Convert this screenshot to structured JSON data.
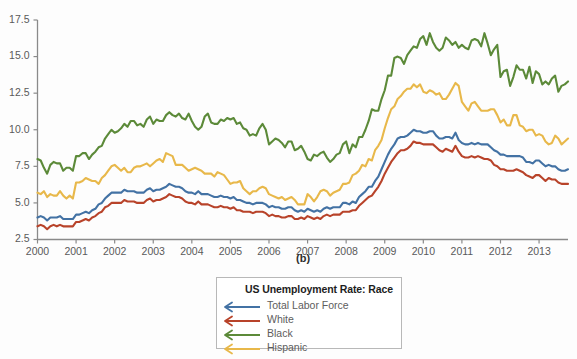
{
  "panel_letter": "(b)",
  "legend": {
    "title": "US Unemployment Rate: Race",
    "items": [
      {
        "label": "Total Labor Force",
        "color": "#4372a4",
        "icon": "left-arrow-icon"
      },
      {
        "label": "White",
        "color": "#b8432a",
        "icon": "left-arrow-icon"
      },
      {
        "label": "Black",
        "color": "#5c8a39",
        "icon": "left-arrow-icon"
      },
      {
        "label": "Hispanic",
        "color": "#e8b84a",
        "icon": "left-arrow-icon"
      }
    ]
  },
  "chart_data": {
    "type": "line",
    "title": "US Unemployment Rate: Race",
    "xlabel": "",
    "ylabel": "",
    "xlim": [
      2000,
      2013.75
    ],
    "ylim": [
      2.5,
      17.5
    ],
    "yticks": [
      "2.5",
      "5.0",
      "7.5",
      "10.0",
      "12.5",
      "15.0",
      "17.5"
    ],
    "ytick_values": [
      2.5,
      5.0,
      7.5,
      10.0,
      12.5,
      15.0,
      17.5
    ],
    "xticks": [
      "2000",
      "2001",
      "2002",
      "2003",
      "2004",
      "2005",
      "2006",
      "2007",
      "2008",
      "2009",
      "2010",
      "2011",
      "2012",
      "2013"
    ],
    "xtick_values": [
      2000,
      2001,
      2002,
      2003,
      2004,
      2005,
      2006,
      2007,
      2008,
      2009,
      2010,
      2011,
      2012,
      2013
    ],
    "grid": false,
    "legend_position": "bottom-center",
    "x_step_years": 0.08333333,
    "series": [
      {
        "name": "Total Labor Force",
        "color": "#4372a4",
        "values": [
          4.0,
          4.1,
          4.0,
          3.8,
          4.0,
          4.0,
          4.0,
          4.1,
          3.9,
          3.9,
          3.9,
          3.9,
          4.2,
          4.2,
          4.3,
          4.4,
          4.3,
          4.5,
          4.6,
          4.9,
          5.0,
          5.3,
          5.5,
          5.7,
          5.7,
          5.7,
          5.7,
          5.9,
          5.8,
          5.8,
          5.8,
          5.7,
          5.7,
          5.7,
          5.9,
          6.0,
          5.8,
          5.9,
          5.9,
          6.0,
          6.1,
          6.3,
          6.2,
          6.1,
          6.1,
          6.0,
          5.8,
          5.7,
          5.7,
          5.6,
          5.8,
          5.6,
          5.6,
          5.6,
          5.5,
          5.4,
          5.4,
          5.5,
          5.4,
          5.4,
          5.3,
          5.4,
          5.2,
          5.2,
          5.1,
          5.0,
          5.0,
          4.9,
          5.0,
          5.0,
          5.0,
          4.9,
          4.7,
          4.8,
          4.7,
          4.7,
          4.6,
          4.6,
          4.7,
          4.7,
          4.5,
          4.4,
          4.5,
          4.4,
          4.6,
          4.5,
          4.4,
          4.5,
          4.4,
          4.6,
          4.7,
          4.6,
          4.7,
          4.7,
          4.7,
          5.0,
          5.0,
          4.9,
          5.1,
          5.0,
          5.4,
          5.6,
          5.8,
          6.1,
          6.1,
          6.5,
          6.8,
          7.3,
          7.8,
          8.3,
          8.7,
          9.0,
          9.4,
          9.5,
          9.5,
          9.6,
          9.8,
          10.0,
          9.9,
          9.9,
          9.8,
          9.8,
          9.9,
          9.9,
          9.6,
          9.4,
          9.4,
          9.5,
          9.5,
          9.4,
          9.8,
          9.3,
          9.1,
          9.0,
          9.0,
          9.1,
          9.0,
          9.1,
          9.0,
          9.0,
          9.0,
          8.8,
          8.6,
          8.5,
          8.3,
          8.3,
          8.2,
          8.2,
          8.2,
          8.2,
          8.2,
          8.1,
          7.8,
          7.8,
          7.7,
          7.9,
          7.9,
          7.7,
          7.5,
          7.6,
          7.5,
          7.5,
          7.3,
          7.2,
          7.2,
          7.3
        ]
      },
      {
        "name": "White",
        "color": "#b8432a",
        "values": [
          3.4,
          3.5,
          3.4,
          3.2,
          3.4,
          3.5,
          3.4,
          3.5,
          3.4,
          3.4,
          3.4,
          3.4,
          3.7,
          3.7,
          3.8,
          3.9,
          3.8,
          4.0,
          4.1,
          4.3,
          4.4,
          4.7,
          4.8,
          5.0,
          5.0,
          5.0,
          5.0,
          5.2,
          5.1,
          5.1,
          5.1,
          5.0,
          5.0,
          5.0,
          5.2,
          5.3,
          5.1,
          5.2,
          5.2,
          5.3,
          5.4,
          5.6,
          5.5,
          5.4,
          5.4,
          5.3,
          5.1,
          5.0,
          5.0,
          4.9,
          5.1,
          4.9,
          4.9,
          4.9,
          4.8,
          4.7,
          4.7,
          4.8,
          4.7,
          4.7,
          4.6,
          4.7,
          4.5,
          4.5,
          4.4,
          4.4,
          4.4,
          4.3,
          4.4,
          4.4,
          4.4,
          4.3,
          4.1,
          4.2,
          4.1,
          4.1,
          4.0,
          4.0,
          4.1,
          4.1,
          3.9,
          3.9,
          4.0,
          3.9,
          4.1,
          4.0,
          3.9,
          4.0,
          3.9,
          4.1,
          4.2,
          4.1,
          4.2,
          4.2,
          4.2,
          4.4,
          4.4,
          4.4,
          4.5,
          4.5,
          4.8,
          5.0,
          5.2,
          5.4,
          5.5,
          5.8,
          6.1,
          6.5,
          7.0,
          7.4,
          7.8,
          8.1,
          8.4,
          8.6,
          8.6,
          8.7,
          8.9,
          9.2,
          9.1,
          9.1,
          9.0,
          9.0,
          9.0,
          9.0,
          8.8,
          8.6,
          8.5,
          8.7,
          8.6,
          8.5,
          8.9,
          8.5,
          8.2,
          8.1,
          8.1,
          8.2,
          8.1,
          8.2,
          8.1,
          8.0,
          8.0,
          7.9,
          7.6,
          7.5,
          7.3,
          7.3,
          7.2,
          7.2,
          7.2,
          7.3,
          7.2,
          7.1,
          6.9,
          6.8,
          6.7,
          6.9,
          6.9,
          6.7,
          6.5,
          6.7,
          6.6,
          6.6,
          6.4,
          6.3,
          6.3,
          6.3
        ]
      },
      {
        "name": "Black",
        "color": "#5c8a39",
        "values": [
          8.0,
          7.9,
          7.4,
          7.0,
          7.6,
          7.8,
          7.7,
          7.7,
          7.2,
          7.4,
          7.4,
          7.2,
          8.2,
          8.2,
          8.4,
          8.4,
          8.0,
          8.3,
          8.5,
          8.8,
          8.9,
          9.4,
          9.7,
          10.0,
          9.8,
          9.9,
          10.1,
          10.4,
          10.2,
          10.6,
          10.6,
          10.3,
          10.4,
          10.2,
          10.7,
          10.9,
          10.4,
          10.7,
          10.6,
          10.6,
          11.0,
          11.2,
          11.0,
          10.9,
          11.1,
          10.8,
          10.7,
          11.1,
          10.6,
          10.2,
          10.0,
          10.2,
          10.9,
          11.1,
          10.5,
          10.4,
          10.4,
          10.7,
          10.6,
          10.8,
          10.7,
          10.8,
          10.4,
          10.5,
          10.1,
          10.0,
          9.6,
          9.7,
          9.6,
          10.1,
          10.4,
          10.0,
          9.0,
          9.2,
          9.4,
          9.3,
          9.1,
          8.8,
          9.2,
          9.2,
          8.6,
          8.7,
          8.9,
          8.5,
          8.0,
          7.9,
          8.3,
          8.2,
          8.4,
          8.5,
          8.1,
          7.8,
          8.0,
          8.3,
          8.4,
          9.0,
          9.2,
          8.4,
          9.0,
          8.8,
          9.5,
          9.5,
          10.0,
          10.6,
          11.4,
          11.3,
          11.3,
          12.1,
          12.7,
          13.7,
          13.7,
          14.9,
          15.0,
          14.9,
          14.5,
          15.1,
          15.4,
          15.7,
          15.6,
          16.2,
          16.4,
          15.8,
          16.6,
          16.0,
          15.6,
          15.4,
          15.6,
          16.3,
          16.1,
          15.8,
          16.0,
          15.6,
          15.8,
          15.6,
          15.5,
          16.1,
          16.2,
          16.1,
          15.7,
          16.6,
          15.9,
          15.1,
          15.5,
          15.8,
          13.6,
          14.0,
          14.1,
          13.0,
          13.6,
          14.4,
          14.1,
          14.1,
          13.5,
          14.3,
          13.2,
          14.0,
          13.8,
          13.1,
          13.3,
          13.1,
          13.5,
          13.7,
          12.6,
          13.0,
          13.1,
          13.3
        ]
      },
      {
        "name": "Hispanic",
        "color": "#e8b84a",
        "values": [
          5.7,
          5.6,
          5.8,
          5.4,
          5.6,
          5.5,
          5.5,
          5.8,
          5.5,
          5.3,
          5.5,
          5.3,
          6.4,
          6.4,
          6.5,
          6.7,
          6.6,
          6.5,
          6.5,
          6.3,
          6.7,
          6.9,
          7.2,
          7.5,
          7.6,
          7.4,
          7.2,
          7.4,
          7.1,
          7.1,
          7.4,
          7.5,
          7.5,
          7.6,
          7.7,
          7.5,
          7.7,
          7.9,
          8.0,
          7.8,
          8.4,
          8.3,
          8.2,
          7.6,
          7.6,
          7.6,
          7.4,
          7.2,
          7.3,
          7.4,
          7.3,
          7.2,
          7.0,
          7.0,
          7.0,
          6.8,
          7.1,
          7.0,
          6.9,
          6.6,
          6.3,
          6.4,
          6.4,
          6.5,
          6.0,
          5.8,
          5.6,
          5.8,
          5.8,
          6.0,
          6.1,
          6.0,
          5.6,
          5.5,
          5.4,
          5.3,
          5.4,
          5.2,
          5.3,
          5.4,
          5.2,
          4.9,
          4.9,
          4.9,
          5.6,
          5.4,
          5.1,
          5.4,
          5.8,
          5.9,
          5.8,
          5.5,
          5.7,
          5.8,
          5.9,
          6.3,
          6.3,
          6.4,
          6.9,
          7.0,
          7.2,
          7.6,
          7.5,
          8.0,
          7.9,
          8.6,
          8.9,
          9.3,
          10.1,
          10.8,
          11.4,
          11.6,
          12.1,
          12.3,
          12.6,
          12.8,
          12.8,
          13.1,
          12.9,
          13.1,
          12.6,
          12.5,
          12.7,
          12.6,
          12.4,
          12.5,
          12.1,
          12.1,
          12.4,
          12.8,
          13.2,
          13.0,
          11.9,
          11.6,
          11.3,
          11.8,
          11.9,
          11.6,
          11.3,
          11.3,
          11.3,
          11.4,
          11.4,
          11.0,
          10.5,
          10.7,
          10.3,
          10.3,
          11.0,
          11.0,
          10.3,
          10.2,
          9.9,
          10.0,
          10.0,
          9.6,
          9.7,
          9.6,
          9.2,
          9.0,
          9.1,
          9.6,
          9.4,
          9.0,
          9.2,
          9.4
        ]
      }
    ]
  }
}
